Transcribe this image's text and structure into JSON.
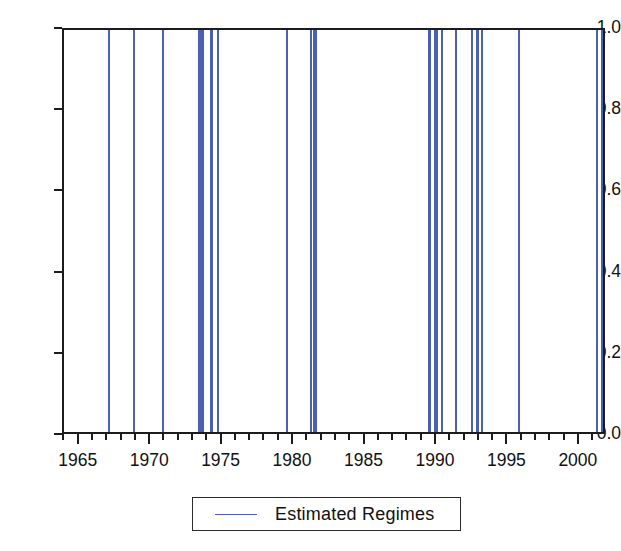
{
  "chart_data": {
    "type": "line",
    "title": "",
    "xlabel": "",
    "ylabel": "",
    "xlim": [
      1963.9,
      2001.9
    ],
    "ylim": [
      0.0,
      1.0
    ],
    "grid": false,
    "legend_position": "bottom-center",
    "series": [
      {
        "name": "Estimated Regimes",
        "color": "#4b60b4",
        "description": "Binary regime indicator: value 1 during estimated regime episodes, 0 otherwise, plotted as narrow vertical spikes.",
        "regime_intervals": [
          [
            1966.95,
            1967.1
          ],
          [
            1968.75,
            1968.9
          ],
          [
            1970.75,
            1970.9
          ],
          [
            1973.25,
            1973.7
          ],
          [
            1974.15,
            1974.3
          ],
          [
            1974.6,
            1974.75
          ],
          [
            1979.45,
            1979.6
          ],
          [
            1981.1,
            1981.25
          ],
          [
            1981.35,
            1981.6
          ],
          [
            1989.4,
            1989.55
          ],
          [
            1989.8,
            1990.05
          ],
          [
            1990.3,
            1990.45
          ],
          [
            1991.25,
            1991.4
          ],
          [
            1992.35,
            1992.5
          ],
          [
            1992.7,
            1992.95
          ],
          [
            1993.1,
            1993.25
          ],
          [
            1995.65,
            1995.8
          ],
          [
            2001.15,
            2001.3
          ],
          [
            2001.45,
            2001.6
          ],
          [
            2001.7,
            2001.85
          ]
        ]
      }
    ],
    "yticks": [
      {
        "value": 0.0,
        "label": "0.0"
      },
      {
        "value": 0.2,
        "label": "0.2"
      },
      {
        "value": 0.4,
        "label": "0.4"
      },
      {
        "value": 0.6,
        "label": "0.6"
      },
      {
        "value": 0.8,
        "label": "0.8"
      },
      {
        "value": 1.0,
        "label": "1.0"
      }
    ],
    "xticks_major": [
      {
        "value": 1965,
        "label": "1965"
      },
      {
        "value": 1970,
        "label": "1970"
      },
      {
        "value": 1975,
        "label": "1975"
      },
      {
        "value": 1980,
        "label": "1980"
      },
      {
        "value": 1985,
        "label": "1985"
      },
      {
        "value": 1990,
        "label": "1990"
      },
      {
        "value": 1995,
        "label": "1995"
      },
      {
        "value": 2000,
        "label": "2000"
      }
    ],
    "xticks_minor_step": 1
  },
  "legend": {
    "entries": [
      {
        "label": "Estimated Regimes",
        "color": "#4b60b4"
      }
    ]
  },
  "colors": {
    "series": "#4b60b4",
    "axis": "#1c1c1c",
    "background": "#ffffff",
    "text": "#111111"
  }
}
